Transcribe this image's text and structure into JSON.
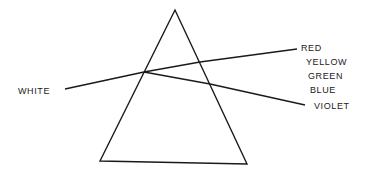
{
  "diagram": {
    "type": "prism-dispersion",
    "stroke_color": "#1a1a1a",
    "background": "#ffffff",
    "prism": {
      "apex": [
        175,
        10
      ],
      "bottom_left": [
        100,
        161
      ],
      "bottom_right": [
        247,
        164
      ]
    },
    "incident_ray": {
      "label": "WHITE",
      "from": [
        65,
        89
      ],
      "to": [
        144,
        72
      ]
    },
    "refracted_rays": [
      {
        "name": "red-edge",
        "points": [
          [
            144,
            72
          ],
          [
            200,
            62
          ],
          [
            297,
            49
          ]
        ]
      },
      {
        "name": "violet-edge",
        "points": [
          [
            144,
            72
          ],
          [
            210,
            84
          ],
          [
            305,
            105
          ]
        ]
      }
    ],
    "labels": {
      "white": "WHITE",
      "spectrum": [
        "RED",
        "YELLOW",
        "GREEN",
        "BLUE",
        "VIOLET"
      ]
    }
  }
}
